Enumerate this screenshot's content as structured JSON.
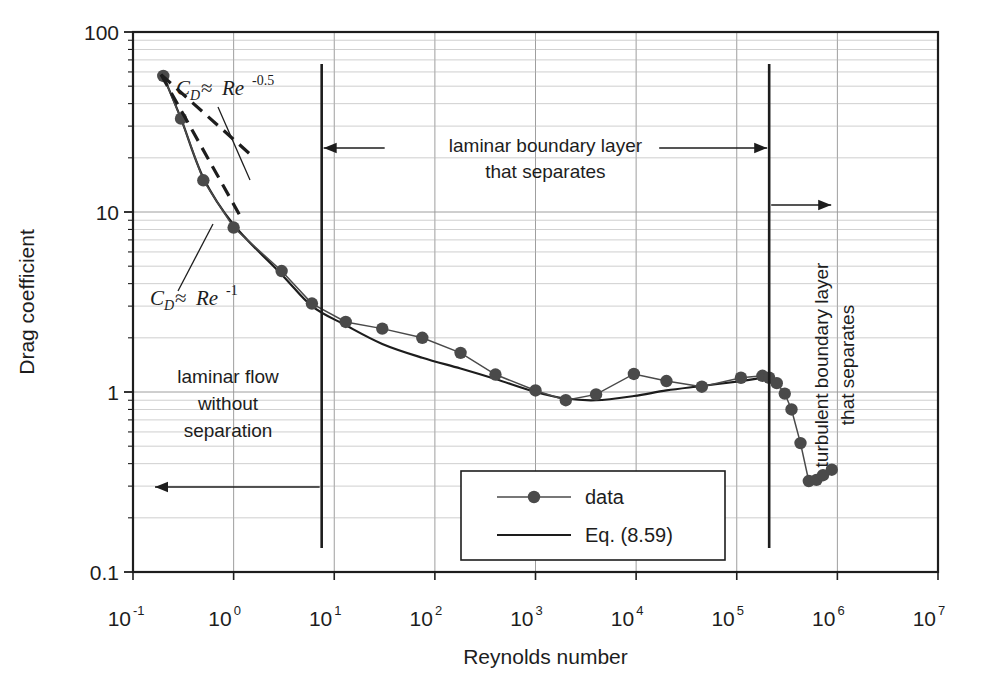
{
  "chart_data": {
    "type": "line",
    "title": "",
    "xlabel": "Reynolds number",
    "ylabel": "Drag coefficient",
    "xscale": "log",
    "yscale": "log",
    "xlim": [
      0.1,
      10000000
    ],
    "ylim": [
      0.1,
      100
    ],
    "grid": "log-minor-both-axes",
    "legend_position": "lower-center-inside",
    "x_tick_labels": [
      "10⁻¹",
      "10⁰",
      "10¹",
      "10²",
      "10³",
      "10⁴",
      "10⁵",
      "10⁶",
      "10⁷"
    ],
    "x_tick_bases": [
      "10",
      "10",
      "10",
      "10",
      "10",
      "10",
      "10",
      "10",
      "10"
    ],
    "x_tick_exponents": [
      "-1",
      "0",
      "1",
      "2",
      "3",
      "4",
      "5",
      "6",
      "7"
    ],
    "x_tick_values": [
      0.1,
      1,
      10,
      100,
      1000,
      10000,
      100000,
      1000000,
      10000000
    ],
    "y_tick_labels": [
      "0.1",
      "1",
      "10",
      "100"
    ],
    "y_tick_values": [
      0.1,
      1,
      10,
      100
    ],
    "series": [
      {
        "name": "data",
        "marker": "filled-circle",
        "line": "solid-thin",
        "color": "#4a4a4a",
        "points": [
          [
            0.2,
            57
          ],
          [
            0.3,
            33
          ],
          [
            0.5,
            15
          ],
          [
            1.0,
            8.2
          ],
          [
            3.0,
            4.7
          ],
          [
            6.0,
            3.1
          ],
          [
            13,
            2.45
          ],
          [
            30,
            2.25
          ],
          [
            75,
            2.0
          ],
          [
            180,
            1.65
          ],
          [
            400,
            1.25
          ],
          [
            1000,
            1.02
          ],
          [
            2000,
            0.9
          ],
          [
            4000,
            0.97
          ],
          [
            9500,
            1.26
          ],
          [
            20000,
            1.15
          ],
          [
            45000,
            1.07
          ],
          [
            110000,
            1.2
          ],
          [
            180000,
            1.23
          ],
          [
            210000,
            1.2
          ],
          [
            250000,
            1.12
          ],
          [
            300000,
            0.98
          ],
          [
            350000,
            0.8
          ],
          [
            430000,
            0.52
          ],
          [
            520000,
            0.32
          ],
          [
            620000,
            0.325
          ],
          [
            720000,
            0.345
          ],
          [
            880000,
            0.37
          ]
        ]
      },
      {
        "name": "Eq. (8.59)",
        "marker": "none",
        "line": "solid",
        "color": "#1d1d1d",
        "points": [
          [
            0.2,
            57
          ],
          [
            0.3,
            33
          ],
          [
            0.5,
            15.5
          ],
          [
            1.0,
            8.5
          ],
          [
            3.0,
            4.5
          ],
          [
            6.0,
            3.0
          ],
          [
            13,
            2.35
          ],
          [
            30,
            1.85
          ],
          [
            75,
            1.55
          ],
          [
            180,
            1.35
          ],
          [
            400,
            1.18
          ],
          [
            1000,
            1.0
          ],
          [
            2000,
            0.92
          ],
          [
            4000,
            0.9
          ],
          [
            9500,
            0.95
          ],
          [
            20000,
            1.02
          ],
          [
            45000,
            1.08
          ],
          [
            110000,
            1.15
          ],
          [
            180000,
            1.2
          ],
          [
            215000,
            1.21
          ]
        ]
      }
    ],
    "asymptotes": [
      {
        "label": "C_D = Re^-0.5",
        "label_base": "C",
        "label_sub": "D",
        "label_op": "≈",
        "label_var": "Re",
        "label_exp": "-0.5",
        "style": "dashed",
        "from": [
          0.19,
          58
        ],
        "to": [
          1.6,
          20
        ]
      },
      {
        "label": "C_D = Re^-1",
        "label_base": "C",
        "label_sub": "D",
        "label_op": "≈",
        "label_var": "Re",
        "label_exp": "-1",
        "style": "dashed",
        "from": [
          0.19,
          58
        ],
        "to": [
          1.2,
          9.2
        ]
      }
    ],
    "region_dividers": [
      {
        "x": 7.5,
        "name": "laminar-separation-onset"
      },
      {
        "x": 210000,
        "name": "drag-crisis-onset"
      }
    ],
    "annotations": [
      {
        "name": "laminar-boundary-layer-region",
        "text_line1": "laminar boundary layer",
        "text_line2": "that separates",
        "orientation": "horizontal",
        "arrows": "double-ended-between-dividers"
      },
      {
        "name": "turbulent-boundary-layer-region",
        "text_line1": "turbulent boundary layer",
        "text_line2": "that separates",
        "orientation": "vertical",
        "arrows": "right-pointing"
      },
      {
        "name": "laminar-flow-region",
        "text_line1": "laminar flow",
        "text_line2": "without",
        "text_line3": "separation",
        "orientation": "horizontal",
        "arrows": "left-pointing"
      }
    ],
    "legend_entries": [
      {
        "label": "data",
        "marker": "filled-circle",
        "line": "solid"
      },
      {
        "label": "Eq. (8.59)",
        "marker": "none",
        "line": "solid"
      }
    ]
  },
  "figure": {
    "background_color": "#ffffff",
    "axis_color": "#1d1d1d",
    "grid_major_color": "#9a9a9a",
    "grid_minor_color": "#b5b5b5",
    "data_color": "#4a4a4a",
    "curve_color": "#1d1d1d"
  }
}
